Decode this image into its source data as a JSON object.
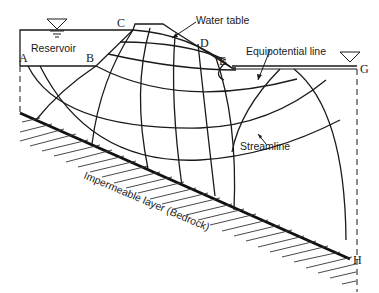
{
  "diagram": {
    "labels": {
      "reservoir": "Reservoir",
      "water_table": "Water table",
      "equipotential_line": "Equipotential line",
      "streamline": "Streamline",
      "impermeable_layer": "Impermeable layer (Bedrock)"
    },
    "points": {
      "A": "A",
      "B": "B",
      "C": "C",
      "D": "D",
      "E": "E",
      "G": "G",
      "H": "H"
    },
    "symbols": {
      "water_level_left": "water-level-triangle",
      "water_level_right": "water-level-triangle"
    },
    "colors": {
      "line": "#1a1a1a",
      "background": "#ffffff"
    }
  }
}
